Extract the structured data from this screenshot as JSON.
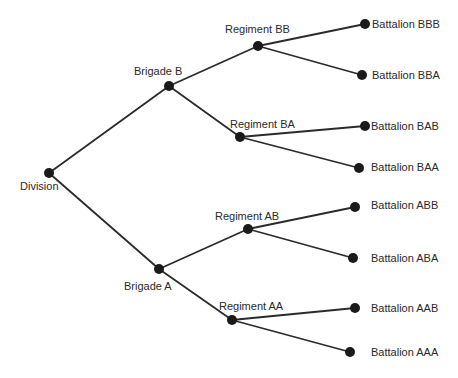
{
  "diagram": {
    "type": "tree",
    "orientation": "left-to-right",
    "colors": {
      "edge": "#2b2b2b",
      "node": "#1a1a1a",
      "label": "#2a2a2a",
      "background": "#ffffff"
    },
    "nodes": [
      {
        "id": "division",
        "label": "Division",
        "parent": null
      },
      {
        "id": "brigade-b",
        "label": "Brigade B",
        "parent": "division"
      },
      {
        "id": "brigade-a",
        "label": "Brigade A",
        "parent": "division"
      },
      {
        "id": "regiment-bb",
        "label": "Regiment BB",
        "parent": "brigade-b"
      },
      {
        "id": "regiment-ba",
        "label": "Regiment BA",
        "parent": "brigade-b"
      },
      {
        "id": "regiment-ab",
        "label": "Regiment AB",
        "parent": "brigade-a"
      },
      {
        "id": "regiment-aa",
        "label": "Regiment AA",
        "parent": "brigade-a"
      },
      {
        "id": "battalion-bbb",
        "label": "Battalion BBB",
        "parent": "regiment-bb"
      },
      {
        "id": "battalion-bba",
        "label": "Battalion BBA",
        "parent": "regiment-bb"
      },
      {
        "id": "battalion-bab",
        "label": "Battalion BAB",
        "parent": "regiment-ba"
      },
      {
        "id": "battalion-baa",
        "label": "Battalion BAA",
        "parent": "regiment-ba"
      },
      {
        "id": "battalion-abb",
        "label": "Battalion ABB",
        "parent": "regiment-ab"
      },
      {
        "id": "battalion-aba",
        "label": "Battalion ABA",
        "parent": "regiment-ab"
      },
      {
        "id": "battalion-aab",
        "label": "Battalion AAB",
        "parent": "regiment-aa"
      },
      {
        "id": "battalion-aaa",
        "label": "Battalion AAA",
        "parent": "regiment-aa"
      }
    ]
  }
}
